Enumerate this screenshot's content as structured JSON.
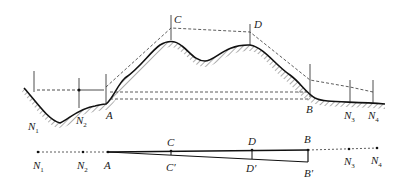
{
  "diagram": {
    "type": "terrain-profile-leveling",
    "top_labels": {
      "N1": "N",
      "N1_sub": "1",
      "N2": "N",
      "N2_sub": "2",
      "A": "A",
      "C": "C",
      "D": "D",
      "B": "B",
      "N3": "N",
      "N3_sub": "3",
      "N4": "N",
      "N4_sub": "4"
    },
    "bottom_labels": {
      "N1": "N",
      "N1_sub": "1",
      "N2": "N",
      "N2_sub": "2",
      "A": "A",
      "C": "C",
      "C_prime": "C′",
      "D": "D",
      "D_prime": "D′",
      "B": "B",
      "B_prime": "B′",
      "N3": "N",
      "N3_sub": "3",
      "N4": "N",
      "N4_sub": "4"
    },
    "colors": {
      "line": "#222222",
      "background": "#ffffff"
    }
  }
}
